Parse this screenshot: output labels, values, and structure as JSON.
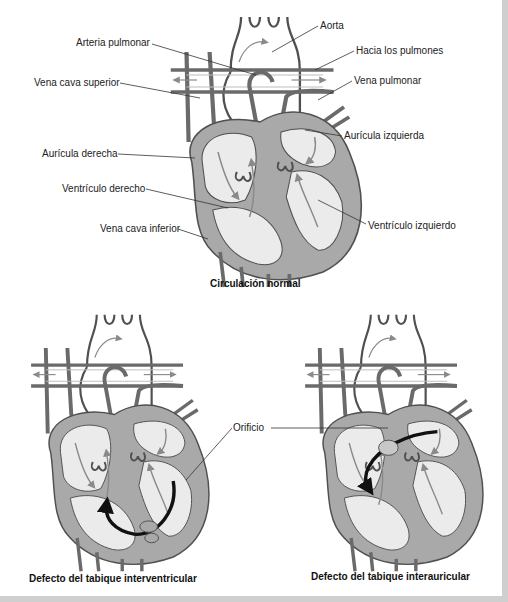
{
  "figure": {
    "panels": [
      {
        "id": "normal",
        "caption": "Circulación normal",
        "labels": [
          {
            "text": "Aorta",
            "x": 320,
            "y": 20
          },
          {
            "text": "Arteria pulmonar",
            "x": 76,
            "y": 37
          },
          {
            "text": "Hacia los pulmones",
            "x": 356,
            "y": 46
          },
          {
            "text": "Vena pulmonar",
            "x": 354,
            "y": 75
          },
          {
            "text": "Vena cava superior",
            "x": 34,
            "y": 76
          },
          {
            "text": "Aurícula izquierda",
            "x": 344,
            "y": 130
          },
          {
            "text": "Aurícula derecha",
            "x": 42,
            "y": 148
          },
          {
            "text": "Ventrículo derecho",
            "x": 62,
            "y": 182
          },
          {
            "text": "Vena cava inferior",
            "x": 100,
            "y": 222
          },
          {
            "text": "Ventrículo izquierdo",
            "x": 368,
            "y": 220
          }
        ]
      },
      {
        "id": "ventricular-septal-defect",
        "caption": "Defecto del tabique interventricular"
      },
      {
        "id": "atrial-septal-defect",
        "caption": "Defecto del tabique interauricular"
      }
    ],
    "shared_label": {
      "text": "Orificio",
      "x": 233,
      "y": 422
    }
  },
  "colors": {
    "wall": "#a9a9a9",
    "chamber": "#ebebeb",
    "outline": "#505050",
    "flow_arrow": "#8a8a8a",
    "defect_arrow": "#111111",
    "frame": "#cfcfcf"
  }
}
